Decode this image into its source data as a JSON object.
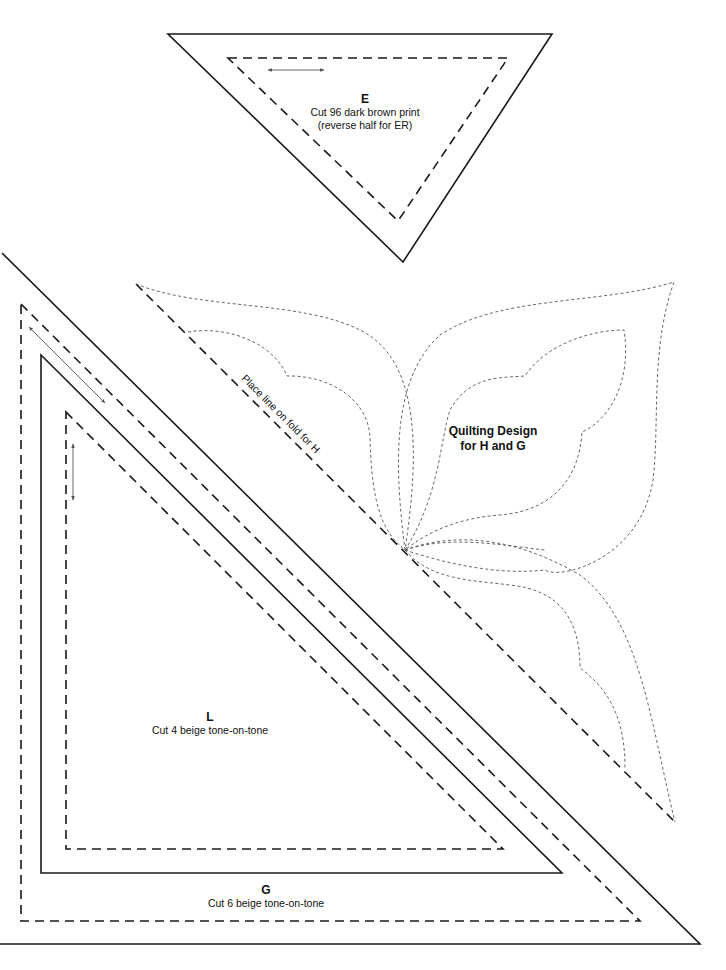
{
  "page": {
    "background": "#ffffff",
    "line_color": "#1a1a1a",
    "quilt_line_color": "#555555"
  },
  "pieces": {
    "E": {
      "letter": "E",
      "line1": "Cut 96 dark brown print",
      "line2": "(reverse half for ER)"
    },
    "L": {
      "letter": "L",
      "line1": "Cut 4 beige tone-on-tone"
    },
    "G": {
      "letter": "G",
      "line1": "Cut 6 beige tone-on-tone"
    }
  },
  "quilting_design": {
    "title_line1": "Quilting Design",
    "title_line2": "for H and G",
    "fold_label": "Place line on fold for H"
  },
  "icons": {
    "grain_arrow_E": "double-headed-horizontal-arrow",
    "grain_arrow_G": "double-headed-diagonal-arrow",
    "grain_arrow_L": "double-headed-vertical-arrow"
  }
}
